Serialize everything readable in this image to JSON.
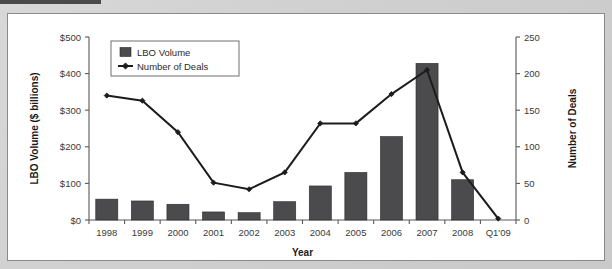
{
  "page": {
    "background_color": "#d3d3d3",
    "panel_color": "#ffffff",
    "panel_border_color": "#8a8a8a",
    "top_strip_color": "#4a4a4a"
  },
  "chart_data": {
    "type": "bar",
    "title": "",
    "subtitle": "",
    "xlabel": "Year",
    "ylabel": "LBO Volume ($ billions)",
    "y2label": "Number of Deals",
    "categories": [
      "1998",
      "1999",
      "2000",
      "2001",
      "2002",
      "2003",
      "2004",
      "2005",
      "2006",
      "2007",
      "2008",
      "Q1'09"
    ],
    "ylim": [
      0,
      500
    ],
    "y2lim": [
      0,
      250
    ],
    "yticks": [
      0,
      100,
      200,
      300,
      400,
      500
    ],
    "ytick_labels": [
      "$0",
      "$100",
      "$200",
      "$300",
      "$400",
      "$500"
    ],
    "y2ticks": [
      0,
      50,
      100,
      150,
      200,
      250
    ],
    "y2tick_labels": [
      "0",
      "50",
      "100",
      "150",
      "200",
      "250"
    ],
    "grid": false,
    "legend_position": "upper-left",
    "series": [
      {
        "name": "LBO Volume",
        "type": "bar",
        "axis": "left",
        "unit": "$ billions",
        "color": "#4b4b4d",
        "values": [
          57,
          52,
          43,
          22,
          20,
          50,
          93,
          130,
          228,
          428,
          110,
          0
        ]
      },
      {
        "name": "Number of Deals",
        "type": "line",
        "axis": "right",
        "unit": "deals",
        "color": "#1c1c1c",
        "marker": "diamond",
        "values": [
          170,
          163,
          120,
          51,
          42,
          65,
          132,
          132,
          172,
          205,
          65,
          2
        ]
      }
    ]
  },
  "legend": {
    "items": [
      {
        "label": "LBO Volume",
        "marker": "filled-square",
        "color": "#4b4b4d"
      },
      {
        "label": "Number of Deals",
        "marker": "line-diamond",
        "color": "#1c1c1c"
      }
    ]
  }
}
